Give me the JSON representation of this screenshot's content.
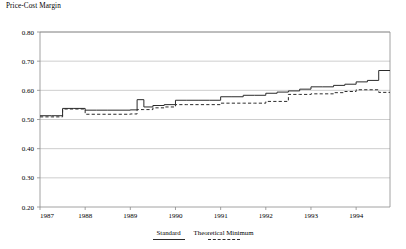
{
  "chart_data": {
    "type": "line",
    "title": "Price-Cost Margin",
    "xlabel": "",
    "ylabel": "Price-Cost Margin",
    "ylim": [
      0.2,
      0.8
    ],
    "ytick_labels": [
      "0.20",
      "0.30",
      "0.40",
      "0.50",
      "0.60",
      "0.70",
      "0.80"
    ],
    "ytick_values": [
      0.2,
      0.3,
      0.4,
      0.5,
      0.6,
      0.7,
      0.8
    ],
    "xlim": [
      1987.0,
      1994.75
    ],
    "xtick_labels": [
      "1987",
      "1988",
      "1989",
      "1990",
      "1991",
      "1992",
      "1993",
      "1994"
    ],
    "xtick_values": [
      1987,
      1988,
      1989,
      1990,
      1991,
      1992,
      1993,
      1994
    ],
    "grid": true,
    "grid_axis": "y",
    "legend_position": "below",
    "drawstyle": "steps-post",
    "series": [
      {
        "name": "Standard",
        "style": "solid",
        "color": "#2b2b2b",
        "x": [
          1987.0,
          1987.25,
          1987.5,
          1987.75,
          1988.0,
          1988.25,
          1988.5,
          1988.75,
          1989.0,
          1989.15,
          1989.3,
          1989.5,
          1989.75,
          1990.0,
          1990.25,
          1990.5,
          1990.75,
          1991.0,
          1991.25,
          1991.5,
          1991.75,
          1992.0,
          1992.25,
          1992.5,
          1992.75,
          1993.0,
          1993.25,
          1993.5,
          1993.75,
          1994.0,
          1994.25,
          1994.5,
          1994.75
        ],
        "values": [
          0.513,
          0.513,
          0.538,
          0.538,
          0.532,
          0.532,
          0.532,
          0.532,
          0.533,
          0.568,
          0.543,
          0.548,
          0.551,
          0.566,
          0.566,
          0.566,
          0.566,
          0.578,
          0.578,
          0.583,
          0.583,
          0.59,
          0.594,
          0.598,
          0.604,
          0.612,
          0.612,
          0.617,
          0.621,
          0.629,
          0.634,
          0.668,
          0.668
        ]
      },
      {
        "name": "Theoretical Minimum",
        "style": "dashed",
        "color": "#2b2b2b",
        "x": [
          1987.0,
          1987.25,
          1987.5,
          1987.75,
          1988.0,
          1988.25,
          1988.5,
          1988.75,
          1989.0,
          1989.15,
          1989.3,
          1989.5,
          1989.75,
          1990.0,
          1990.25,
          1990.5,
          1990.75,
          1991.0,
          1991.25,
          1991.5,
          1991.75,
          1992.0,
          1992.25,
          1992.5,
          1992.75,
          1993.0,
          1993.25,
          1993.5,
          1993.75,
          1994.0,
          1994.25,
          1994.5,
          1994.75
        ],
        "values": [
          0.509,
          0.509,
          0.536,
          0.536,
          0.518,
          0.518,
          0.518,
          0.518,
          0.519,
          0.534,
          0.534,
          0.54,
          0.543,
          0.551,
          0.551,
          0.551,
          0.551,
          0.556,
          0.556,
          0.556,
          0.556,
          0.562,
          0.562,
          0.586,
          0.586,
          0.588,
          0.588,
          0.592,
          0.596,
          0.602,
          0.602,
          0.593,
          0.593
        ]
      }
    ]
  },
  "legend": {
    "entries": [
      {
        "label": "Standard",
        "style": "solid"
      },
      {
        "label": "Theoretical Minimum",
        "style": "dashed"
      }
    ]
  }
}
